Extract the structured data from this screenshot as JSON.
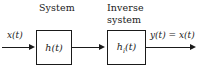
{
  "figure": {
    "type": "block-diagram",
    "background_color": "#ffffff",
    "stroke_color": "#1a1a1a"
  },
  "captions": {
    "system": "System",
    "inverse_line1": "Inverse",
    "inverse_line2": "system"
  },
  "signals": {
    "input": "x(t)",
    "output": "y(t) = x(t)"
  },
  "blocks": [
    {
      "id": "system",
      "label_base": "h",
      "label_sub": "",
      "label_arg": "(t)",
      "label_full": "h(t)"
    },
    {
      "id": "inverse",
      "label_base": "h",
      "label_sub": "i",
      "label_arg": "(t)",
      "label_full": "hi(t)"
    }
  ],
  "connections": [
    {
      "from": "input",
      "to": "system",
      "has_arrowhead": true
    },
    {
      "from": "system",
      "to": "inverse",
      "has_arrowhead": true
    },
    {
      "from": "inverse",
      "to": "output",
      "has_arrowhead": true
    }
  ]
}
